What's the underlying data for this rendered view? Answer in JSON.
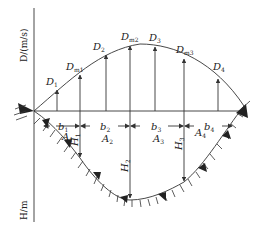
{
  "diagram": {
    "axes": {
      "y_top_label": "D/(m/s)",
      "y_bottom_label": "H/m"
    },
    "velocity_points": [
      {
        "name": "D",
        "sub": "1",
        "x": 57,
        "top": 88
      },
      {
        "name": "D",
        "sub": "m1",
        "x": 80,
        "top": 73
      },
      {
        "name": "D",
        "sub": "2",
        "x": 106,
        "top": 53
      },
      {
        "name": "D",
        "sub": "m2",
        "x": 130,
        "top": 44
      },
      {
        "name": "D",
        "sub": "3",
        "x": 155,
        "top": 45
      },
      {
        "name": "D",
        "sub": "m3",
        "x": 184,
        "top": 57
      },
      {
        "name": "D",
        "sub": "4",
        "x": 218,
        "top": 77
      }
    ],
    "widths": [
      {
        "name": "b",
        "sub": "1"
      },
      {
        "name": "b",
        "sub": "2"
      },
      {
        "name": "b",
        "sub": "3"
      },
      {
        "name": "b",
        "sub": "4"
      }
    ],
    "areas": [
      {
        "name": "A",
        "sub": "1"
      },
      {
        "name": "A",
        "sub": "2"
      },
      {
        "name": "A",
        "sub": "3"
      },
      {
        "name": "A",
        "sub": "4"
      }
    ],
    "depths": [
      {
        "name": "H",
        "sub": "1"
      },
      {
        "name": "H",
        "sub": "2"
      },
      {
        "name": "H",
        "sub": "3"
      }
    ],
    "colors": {
      "line": "#333333",
      "background": "#ffffff"
    }
  }
}
